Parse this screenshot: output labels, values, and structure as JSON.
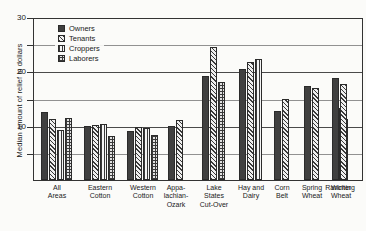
{
  "chart_data": {
    "type": "bar",
    "title": "",
    "xlabel": "",
    "ylabel": "Median amount of relief in dollars",
    "ylim": [
      0,
      30
    ],
    "yticks": [
      0,
      5,
      10,
      15,
      20,
      25,
      30
    ],
    "ytick_labels": [
      "",
      "",
      "10",
      "",
      "20",
      "",
      "30"
    ],
    "major_ticks": [
      10,
      20,
      30
    ],
    "grid": true,
    "legend_position": "upper-left",
    "legend": [
      "Owners",
      "Tenants",
      "Croppers",
      "Laborers"
    ],
    "categories": [
      "All Areas",
      "Eastern Cotton",
      "Western Cotton",
      "Appalachian-Ozark",
      "Lake States Cut-Over",
      "Hay and Dairy",
      "Corn Belt",
      "Spring Wheat",
      "Winter Wheat",
      "Ranching"
    ],
    "series": [
      {
        "name": "Owners",
        "values": [
          12.7,
          10.0,
          9.2,
          10.1,
          19.4,
          20.6,
          12.8,
          17.5,
          13.5,
          19.0
        ]
      },
      {
        "name": "Tenants",
        "values": [
          11.4,
          10.3,
          9.8,
          11.1,
          24.8,
          22.0,
          15.1,
          17.1,
          11.4,
          17.9
        ]
      },
      {
        "name": "Croppers",
        "values": [
          9.3,
          10.4,
          9.7,
          null,
          null,
          22.5,
          null,
          null,
          null,
          null
        ]
      },
      {
        "name": "Laborers",
        "values": [
          11.6,
          8.2,
          8.3,
          null,
          18.2,
          null,
          null,
          null,
          null,
          null
        ]
      }
    ]
  },
  "axis": {
    "tick_30": "30",
    "tick_20": "20",
    "tick_10": "10"
  },
  "xtick_lines": [
    [
      "All",
      "Areas"
    ],
    [
      "Eastern",
      "Cotton"
    ],
    [
      "Western",
      "Cotton"
    ],
    [
      "Appa-",
      "lachian-",
      "Ozark"
    ],
    [
      "Lake",
      "States",
      "Cut-Over"
    ],
    [
      "Hay and",
      "Dairy"
    ],
    [
      "Corn",
      "Belt"
    ],
    [
      "Spring",
      "Wheat"
    ],
    [
      "Winter",
      "Wheat"
    ],
    [
      "Ranching"
    ]
  ]
}
